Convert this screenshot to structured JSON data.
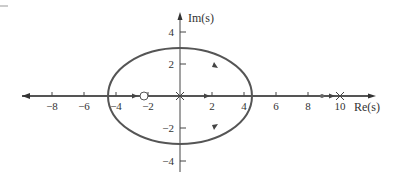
{
  "diagram": {
    "type": "root-locus",
    "axes": {
      "real_axis_label": "Re(s)",
      "imag_axis_label": "Im(s)",
      "x_ticks": [
        {
          "value": -8,
          "label": "−8"
        },
        {
          "value": -6,
          "label": "−6"
        },
        {
          "value": -4,
          "label": "−4"
        },
        {
          "value": -2,
          "label": "−2"
        },
        {
          "value": 2,
          "label": "2"
        },
        {
          "value": 4,
          "label": "4"
        },
        {
          "value": 6,
          "label": "6"
        },
        {
          "value": 8,
          "label": "8"
        },
        {
          "value": 10,
          "label": "10"
        }
      ],
      "y_ticks": [
        {
          "value": 4,
          "label": "4"
        },
        {
          "value": 2,
          "label": "2"
        },
        {
          "value": -2,
          "label": "−2"
        },
        {
          "value": -4,
          "label": "−4"
        }
      ]
    },
    "locus_circle": {
      "center": [
        0,
        0
      ],
      "radius": 3
    },
    "poles": [
      {
        "re": 0,
        "im": 0
      },
      {
        "re": 10,
        "im": 0
      }
    ],
    "zeros": [
      {
        "re": -1.5,
        "im": 0
      }
    ],
    "colors": {
      "locus": "#555555",
      "axis": "#333333"
    }
  }
}
